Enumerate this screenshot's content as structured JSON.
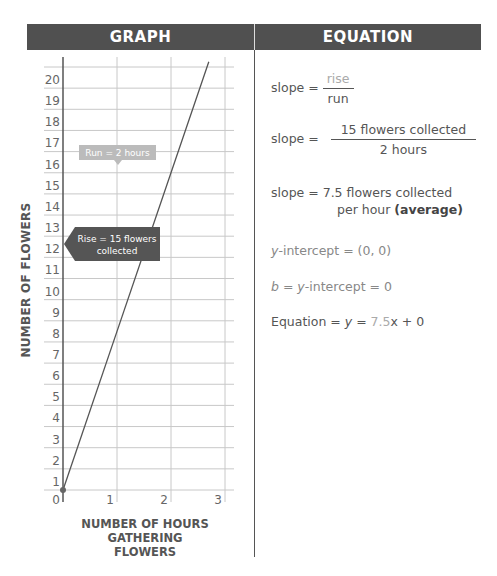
{
  "headers": {
    "graph": "GRAPH",
    "equation": "EQUATION"
  },
  "axes": {
    "ylabel": "NUMBER OF FLOWERS",
    "xlabel_line1": "NUMBER OF HOURS",
    "xlabel_line2": "GATHERING FLOWERS"
  },
  "annotations": {
    "run": "Run = 2 hours",
    "rise_line1": "Rise = 15 flowers",
    "rise_line2": "collected"
  },
  "equation": {
    "slope1_label": "slope = ",
    "slope1_num": "rise",
    "slope1_den": "run",
    "slope2_label": "slope = ",
    "slope2_num": "15 flowers collected",
    "slope2_den": "2 hours",
    "slope3_line1": "slope = 7.5 flowers collected",
    "slope3_line2a": "per hour ",
    "slope3_line2b": "(average)",
    "yint_var": "y",
    "yint_rest": "-intercept = (0, 0)",
    "b_var": "b",
    "b_mid": " = ",
    "b_var2": "y",
    "b_rest": "-intercept = 0",
    "eq_label": "Equation = ",
    "eq_y": "y",
    "eq_eq": " = ",
    "eq_slope": "7.5",
    "eq_rest": "x + 0"
  },
  "colors": {
    "header_bg": "#505050",
    "grid": "#c8c8c8",
    "line": "#555555",
    "callout_dark": "#555555",
    "callout_light": "#bbbbbb"
  },
  "chart_data": {
    "type": "line",
    "title": "GRAPH",
    "xlabel": "NUMBER OF HOURS GATHERING FLOWERS",
    "ylabel": "NUMBER OF FLOWERS",
    "x_ticks": [
      0,
      1,
      2,
      3
    ],
    "y_ticks": [
      0,
      1,
      2,
      3,
      4,
      5,
      6,
      7,
      8,
      9,
      10,
      11,
      12,
      13,
      14,
      15,
      16,
      17,
      18,
      19,
      20
    ],
    "xlim": [
      0,
      3
    ],
    "ylim": [
      0,
      20
    ],
    "grid": true,
    "series": [
      {
        "name": "y = 7.5x",
        "x": [
          0,
          1,
          2,
          2.7
        ],
        "y": [
          0,
          7.5,
          15,
          20.25
        ]
      }
    ],
    "annotations": [
      "Run = 2 hours",
      "Rise = 15 flowers collected"
    ],
    "origin_point": [
      0,
      0
    ]
  }
}
